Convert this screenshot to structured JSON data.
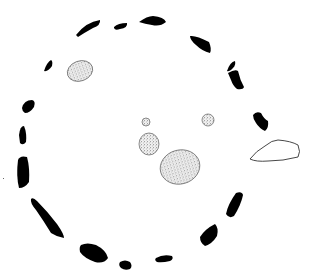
{
  "figure": {
    "kind": "stone circle site plan"
  },
  "legend_styles": {
    "solid": "upright stone (solid black)",
    "stipple": "interior / fallen stone (stippled)",
    "outline": "outlying stone (outline only)"
  },
  "colors": {
    "stone_fill": "#000000",
    "background": "#ffffff",
    "stipple_dot": "#222222"
  },
  "ring_stones": [
    {
      "id": "s1",
      "style": "solid",
      "path": "M76 35 Q86 22 100 20 Q101 25 93 28 Q84 33 78 37 Z"
    },
    {
      "id": "s2",
      "style": "solid",
      "path": "M114 27 Q118 23 127 23 Q128 28 120 29 Q115 31 114 28 Z"
    },
    {
      "id": "s3",
      "style": "solid",
      "path": "M139 22 Q147 16 153 16 Q164 17 166 22 Q160 27 152 25 Q145 24 139 22 Z"
    },
    {
      "id": "s4",
      "style": "solid",
      "path": "M190 36 Q196 35 209 42 Q212 49 210 53 Q202 51 196 45 Q190 40 190 36 Z"
    },
    {
      "id": "s5a",
      "style": "solid",
      "path": "M227 71 Q230 62 235 61 Q236 65 233 68 Q229 72 227 71 Z"
    },
    {
      "id": "s5b",
      "style": "solid",
      "path": "M228 73 Q235 69 238 71 Q240 80 244 87 Q243 90 237 89 Q233 86 231 80 Z"
    },
    {
      "id": "s6",
      "style": "solid",
      "path": "M253 115 Q256 111 261 113 Q264 119 268 121 Q269 128 265 131 Q259 128 256 123 Q253 119 253 115 Z"
    },
    {
      "id": "s7",
      "style": "solid",
      "path": "M44 71 Q47 62 51 60 Q53 61 52 66 Q48 72 44 71 Z"
    },
    {
      "id": "s8",
      "style": "solid",
      "path": "M22 108 Q24 100 32 100 Q36 101 34 107 Q30 113 25 113 Q22 111 22 108 Z"
    },
    {
      "id": "s9",
      "style": "solid",
      "path": "M19 135 Q20 126 24 126 Q27 133 26 142 Q23 146 20 143 Z"
    },
    {
      "id": "s10",
      "style": "solid",
      "path": "M18 160 Q20 155 27 157 Q30 168 29 182 Q25 188 19 188 Q16 176 18 160 Z"
    },
    {
      "id": "s11",
      "style": "solid",
      "path": "M31 199 Q33 197 37 201 Q48 212 57 224 Q64 234 64 238 Q57 237 51 233 Q43 220 36 210 Q30 203 31 199 Z"
    },
    {
      "id": "s12",
      "style": "solid",
      "path": "M81 245 Q87 242 96 245 Q106 250 108 258 Q104 264 95 262 Q84 258 80 252 Q79 247 81 245 Z"
    },
    {
      "id": "s13",
      "style": "solid",
      "path": "M120 262 Q125 259 130 262 Q133 266 130 269 Q125 271 121 268 Q118 265 120 262 Z"
    },
    {
      "id": "s14",
      "style": "solid",
      "path": "M156 258 Q163 254 172 256 Q174 259 170 261 Q162 263 157 262 Q154 260 156 258 Z"
    },
    {
      "id": "s15",
      "style": "solid",
      "path": "M200 237 Q205 229 215 224 Q219 228 217 236 Q212 244 205 246 Q200 243 200 237 Z"
    },
    {
      "id": "s16",
      "style": "solid",
      "path": "M226 214 Q228 204 236 193 Q242 191 243 195 Q241 205 234 216 Q229 219 226 214 Z"
    }
  ],
  "interior_stones": [
    {
      "id": "i1",
      "style": "stipple",
      "cx": 80,
      "cy": 71,
      "rx": 13,
      "ry": 10,
      "rot": -20
    },
    {
      "id": "i2",
      "style": "stipple",
      "cx": 146,
      "cy": 122,
      "rx": 4,
      "ry": 4,
      "rot": 0
    },
    {
      "id": "i3",
      "style": "stipple",
      "cx": 208,
      "cy": 120,
      "rx": 6,
      "ry": 6,
      "rot": 0
    },
    {
      "id": "i4",
      "style": "stipple",
      "cx": 149,
      "cy": 144,
      "rx": 10,
      "ry": 11,
      "rot": 0
    },
    {
      "id": "i5",
      "style": "stipple",
      "cx": 180,
      "cy": 167,
      "rx": 20,
      "ry": 17,
      "rot": -15
    }
  ],
  "outlying_stones": [
    {
      "id": "o1",
      "style": "outline",
      "path": "M250 159 Q256 151 265 146 Q272 140 278 140 Q291 141 298 145 Q301 152 298 157 Q283 161 268 161 Q256 162 250 159 Z"
    }
  ],
  "marks": [
    {
      "id": "m1",
      "x": 3,
      "y": 178,
      "w": 1,
      "h": 1
    }
  ]
}
